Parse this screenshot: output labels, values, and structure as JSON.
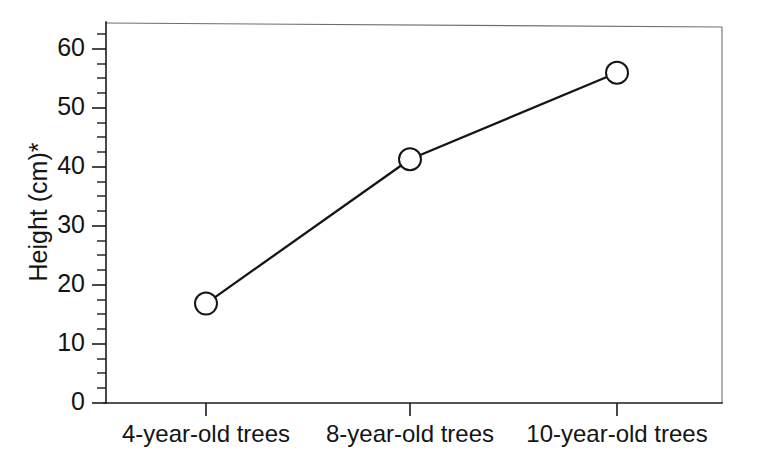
{
  "chart_data": {
    "type": "line",
    "title": "",
    "subtitle": "",
    "xlabel": "",
    "ylabel": "Height (cm)*",
    "categories": [
      "4-year-old trees",
      "8-year-old trees",
      "10-year-old trees"
    ],
    "values": [
      17,
      41.7,
      56.5
    ],
    "series": [
      {
        "name": "Height",
        "values": [
          17,
          41.7,
          56.5
        ]
      }
    ],
    "ylim": [
      0,
      65
    ],
    "ytick_labels": [
      "0",
      "10",
      "20",
      "30",
      "40",
      "50",
      "60"
    ],
    "ytick_values": [
      0,
      10,
      20,
      30,
      40,
      50,
      60
    ],
    "yminor_step": 2.5,
    "grid": false,
    "legend": "none",
    "marker": "open-circle",
    "line_color": "#15141a",
    "marker_fill": "#ffffff",
    "background": "#ffffff",
    "annotations": [
      "*"
    ]
  }
}
